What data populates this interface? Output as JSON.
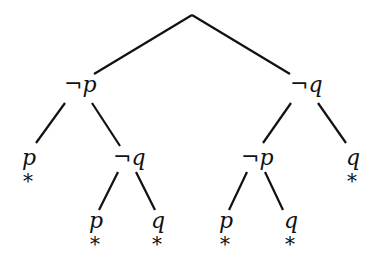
{
  "diagram": {
    "type": "semantic tableau tree",
    "root": {
      "x": 192,
      "y": 15
    },
    "nodes": [
      {
        "id": "n1",
        "neg": "¬",
        "var": "p",
        "x": 80,
        "y": 92,
        "closed": false
      },
      {
        "id": "n2",
        "neg": "¬",
        "var": "q",
        "x": 305,
        "y": 92,
        "closed": false
      },
      {
        "id": "n3",
        "neg": "",
        "var": "p",
        "x": 30,
        "y": 165,
        "closed": true
      },
      {
        "id": "n4",
        "neg": "¬",
        "var": "q",
        "x": 130,
        "y": 165,
        "closed": false
      },
      {
        "id": "n5",
        "neg": "¬",
        "var": "p",
        "x": 258,
        "y": 165,
        "closed": false
      },
      {
        "id": "n6",
        "neg": "",
        "var": "q",
        "x": 352,
        "y": 165,
        "closed": true
      },
      {
        "id": "n7",
        "neg": "",
        "var": "p",
        "x": 95,
        "y": 228,
        "closed": true
      },
      {
        "id": "n8",
        "neg": "",
        "var": "q",
        "x": 157,
        "y": 228,
        "closed": true
      },
      {
        "id": "n9",
        "neg": "",
        "var": "p",
        "x": 225,
        "y": 228,
        "closed": true
      },
      {
        "id": "n10",
        "neg": "",
        "var": "q",
        "x": 290,
        "y": 228,
        "closed": true
      }
    ],
    "closed_marker": "*",
    "labels": {
      "n1": "¬p",
      "n2": "¬q",
      "n3": "p",
      "n4": "¬q",
      "n5": "¬p",
      "n6": "q",
      "n7": "p",
      "n8": "q",
      "n9": "p",
      "n10": "q",
      "star": "*"
    }
  }
}
